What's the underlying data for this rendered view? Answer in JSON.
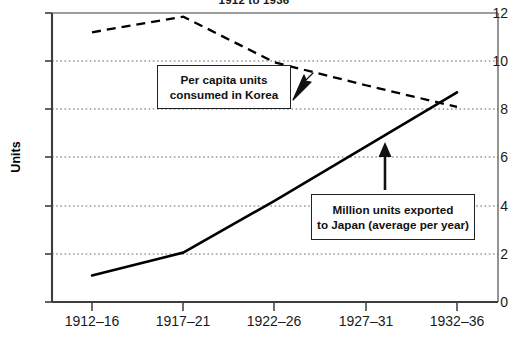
{
  "chart_data": {
    "type": "line",
    "title": "1912 to 1936",
    "xlabel": "",
    "ylabel": "Units",
    "ylim": [
      0,
      12
    ],
    "yticks": [
      0,
      2,
      4,
      6,
      8,
      10,
      12
    ],
    "grid": true,
    "legend_position": "inline-annotations",
    "categories": [
      "1912–16",
      "1917–21",
      "1922–26",
      "1927–31",
      "1932–36"
    ],
    "series": [
      {
        "name": "Per capita units consumed in Korea",
        "style": "dashed",
        "color": "#000000",
        "values": [
          11.2,
          11.85,
          9.95,
          9.0,
          8.1
        ]
      },
      {
        "name": "Million units exported to Japan (average per year)",
        "style": "solid",
        "color": "#000000",
        "values": [
          1.1,
          2.05,
          4.2,
          6.45,
          8.7
        ]
      }
    ],
    "annotations": [
      {
        "id": "korea-label",
        "line1": "Per capita units",
        "line2": "consumed in Korea",
        "points_to": "dashed-series",
        "arrow": "up-right"
      },
      {
        "id": "japan-label",
        "line1": "Million units exported",
        "line2": "to Japan (average per year)",
        "points_to": "solid-series",
        "arrow": "up"
      }
    ]
  },
  "icons": {
    "arrow_up_right": "arrow-up-right-icon",
    "arrow_up": "arrow-up-icon"
  }
}
